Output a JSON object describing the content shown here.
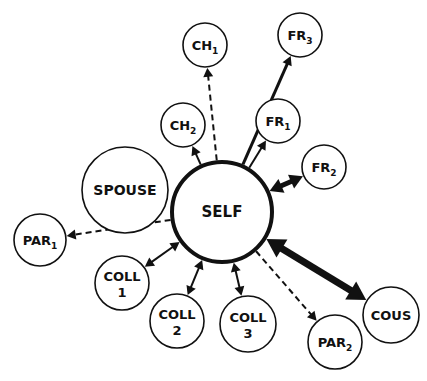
{
  "diagram": {
    "type": "social-network",
    "center": {
      "id": "self",
      "label": "SELF",
      "x": 222,
      "y": 212,
      "r": 50,
      "stroke": 4
    },
    "nodes": [
      {
        "id": "ch1",
        "label": "CH",
        "sub": "1",
        "x": 205,
        "y": 45,
        "r": 22
      },
      {
        "id": "fr3",
        "label": "FR",
        "sub": "3",
        "x": 300,
        "y": 35,
        "r": 22
      },
      {
        "id": "ch2",
        "label": "CH",
        "sub": "2",
        "x": 183,
        "y": 125,
        "r": 22
      },
      {
        "id": "fr1",
        "label": "FR",
        "sub": "1",
        "x": 278,
        "y": 121,
        "r": 22
      },
      {
        "id": "fr2",
        "label": "FR",
        "sub": "2",
        "x": 324,
        "y": 167,
        "r": 22
      },
      {
        "id": "spouse",
        "label": "SPOUSE",
        "sub": "",
        "x": 125,
        "y": 190,
        "r": 43
      },
      {
        "id": "par1",
        "label": "PAR",
        "sub": "1",
        "x": 40,
        "y": 240,
        "r": 26
      },
      {
        "id": "coll1",
        "label": "COLL",
        "line2": "1",
        "x": 122,
        "y": 283,
        "r": 27
      },
      {
        "id": "coll2",
        "label": "COLL",
        "line2": "2",
        "x": 177,
        "y": 321,
        "r": 27
      },
      {
        "id": "coll3",
        "label": "COLL",
        "line2": "3",
        "x": 248,
        "y": 324,
        "r": 28
      },
      {
        "id": "par2",
        "label": "PAR",
        "sub": "2",
        "x": 335,
        "y": 342,
        "r": 27
      },
      {
        "id": "cous",
        "label": "COUS",
        "sub": "",
        "x": 391,
        "y": 315,
        "r": 28
      }
    ],
    "edges": [
      {
        "to": "ch1",
        "style": "dashed",
        "direction": "out",
        "width": 2
      },
      {
        "to": "fr3",
        "style": "solid",
        "direction": "out",
        "width": 3
      },
      {
        "to": "ch2",
        "style": "solid",
        "direction": "out",
        "width": 2
      },
      {
        "to": "fr1",
        "style": "solid",
        "direction": "out",
        "width": 2
      },
      {
        "to": "fr2",
        "style": "solid",
        "direction": "both",
        "width": 5
      },
      {
        "to": "par1",
        "style": "dashed",
        "direction": "out",
        "width": 2
      },
      {
        "to": "coll1",
        "style": "solid",
        "direction": "both",
        "width": 2
      },
      {
        "to": "coll2",
        "style": "solid",
        "direction": "both",
        "width": 2
      },
      {
        "to": "coll3",
        "style": "solid",
        "direction": "both",
        "width": 2
      },
      {
        "to": "par2",
        "style": "dashed",
        "direction": "out",
        "width": 2
      },
      {
        "to": "cous",
        "style": "solid",
        "direction": "both",
        "width": 7
      }
    ]
  }
}
